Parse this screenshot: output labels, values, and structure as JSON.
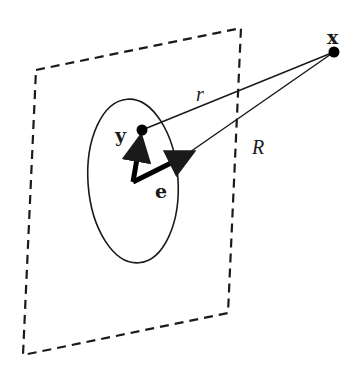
{
  "diagram": {
    "type": "geometry",
    "labels": {
      "point_x": "x",
      "point_y": "y",
      "vector_e": "e",
      "distance_r": "r",
      "distance_R": "R"
    },
    "nodes": [
      {
        "id": "x",
        "label": "x",
        "style": "bold",
        "position": [
          334,
          52
        ]
      },
      {
        "id": "y",
        "label": "y",
        "style": "bold",
        "position": [
          142,
          130
        ]
      },
      {
        "id": "origin",
        "label": "",
        "position": [
          133,
          182
        ]
      }
    ],
    "edges": [
      {
        "from": "y",
        "to": "x",
        "label": "r",
        "style": "thin"
      },
      {
        "from": "origin",
        "to": "x",
        "label": "R",
        "style": "thin"
      },
      {
        "from": "origin",
        "to": "y",
        "label": "",
        "style": "thick-arrow"
      },
      {
        "from": "origin",
        "to": "e_tip",
        "label": "e",
        "style": "thick-arrow"
      }
    ],
    "shapes": [
      {
        "type": "dashed-parallelogram",
        "corners": [
          [
            36,
            70
          ],
          [
            241,
            28
          ],
          [
            228,
            313
          ],
          [
            23,
            355
          ]
        ]
      },
      {
        "type": "ellipse",
        "center": [
          133,
          181
        ],
        "rx": 45,
        "ry": 82
      }
    ],
    "colors": {
      "stroke": "#1a1a1a",
      "background": "#ffffff"
    }
  }
}
